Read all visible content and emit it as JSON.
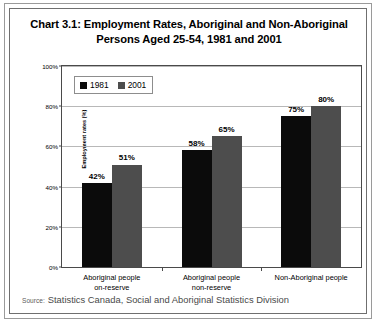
{
  "figure": {
    "title": "Chart 3.1:  Employment Rates, Aboriginal and Non-Aboriginal Persons Aged 25-54, 1981 and 2001",
    "title_line1": "Chart 3.1:  Employment Rates, Aboriginal and Non-Aboriginal",
    "title_line2": "Persons Aged 25-54, 1981 and 2001",
    "source_prefix": "Source:",
    "source_text": "Statistics Canada, Social and Aboriginal Statistics Division"
  },
  "chart_data": {
    "type": "bar",
    "title": "Chart 3.1:  Employment Rates, Aboriginal and Non-Aboriginal Persons Aged 25-54, 1981 and 2001",
    "xlabel": "",
    "ylabel": "Employment rates (%)",
    "ylim": [
      0,
      100
    ],
    "yticks": [
      0,
      20,
      40,
      60,
      80,
      100
    ],
    "ytick_labels": [
      "0%",
      "20%",
      "40%",
      "60%",
      "80%",
      "100%"
    ],
    "grid": true,
    "legend_position": "upper-left",
    "categories": [
      "Aboriginal people on-reserve",
      "Aboriginal people non-reserve",
      "Non-Aboriginal people"
    ],
    "category_lines": [
      [
        "Aboriginal people",
        "on-reserve"
      ],
      [
        "Aboriginal people",
        "non-reserve"
      ],
      [
        "Non-Aboriginal people",
        ""
      ]
    ],
    "series": [
      {
        "name": "1981",
        "color": "#0b0b0b",
        "values": [
          42,
          58,
          75
        ],
        "value_labels": [
          "42%",
          "58%",
          "75%"
        ]
      },
      {
        "name": "2001",
        "color": "#4d4d4d",
        "values": [
          51,
          65,
          80
        ],
        "value_labels": [
          "51%",
          "65%",
          "80%"
        ]
      }
    ]
  }
}
